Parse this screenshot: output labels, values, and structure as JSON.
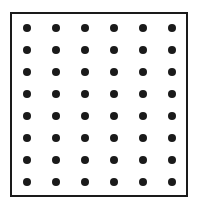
{
  "diagram": {
    "type": "dot-grid",
    "rows": 8,
    "columns": 6,
    "dot_color": "#1a1a1a",
    "border_color": "#1a1a1a"
  }
}
